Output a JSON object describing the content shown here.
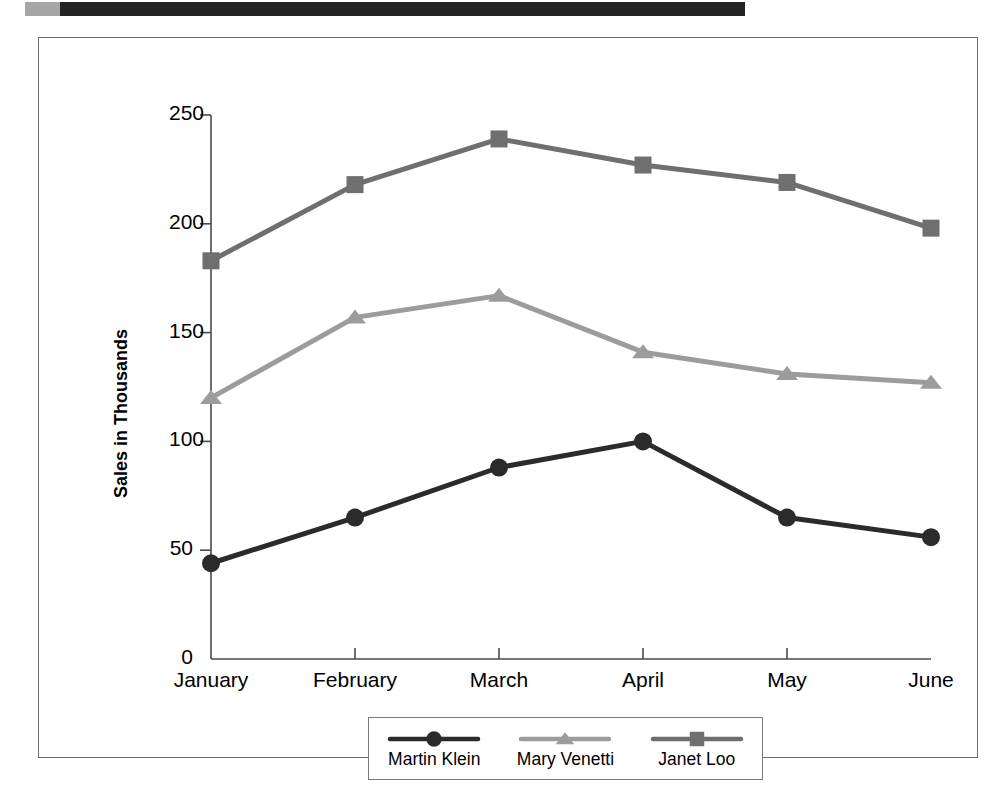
{
  "figure": {
    "copyright": "© Cengage Learning 2013"
  },
  "chart_data": {
    "type": "line",
    "title": "",
    "xlabel": "",
    "ylabel": "Sales in Thousands",
    "categories": [
      "January",
      "February",
      "March",
      "April",
      "May",
      "June"
    ],
    "ylim": [
      0,
      250
    ],
    "yticks": [
      0,
      50,
      100,
      150,
      200,
      250
    ],
    "ytick_labels": [
      "0",
      "50",
      "100",
      "150",
      "200",
      "250"
    ],
    "grid": false,
    "legend_position": "bottom",
    "series": [
      {
        "name": "Martin Klein",
        "marker": "circle",
        "color": "#2b2b2b",
        "values": [
          44,
          65,
          88,
          100,
          65,
          56
        ]
      },
      {
        "name": "Mary Venetti",
        "marker": "triangle",
        "color": "#9c9c9c",
        "values": [
          120,
          157,
          167,
          141,
          131,
          127
        ]
      },
      {
        "name": "Janet Loo",
        "marker": "square",
        "color": "#6f6f6f",
        "values": [
          183,
          218,
          239,
          227,
          219,
          198
        ]
      }
    ]
  }
}
